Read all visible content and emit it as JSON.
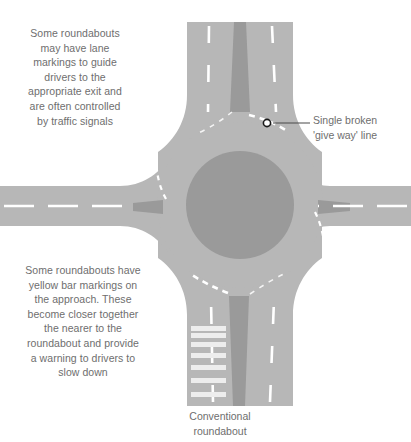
{
  "figure": {
    "caption": "Conventional\nroundabout",
    "notes": [
      {
        "id": "lane-markings-note",
        "text": "Some roundabouts\nmay have lane\nmarkings to guide\ndrivers to the\nappropriate exit and\nare often controlled\nby traffic signals"
      },
      {
        "id": "yellow-bar-note",
        "text": "Some roundabouts have\nyellow bar markings on\nthe approach. These\nbecome closer together\nthe nearer to the\nroundabout and provide\na warning to drivers to\nslow down"
      }
    ],
    "callouts": [
      {
        "id": "give-way-line-callout",
        "text": "Single broken\n'give way' line",
        "marker_x": 267,
        "marker_y": 123,
        "line_end_x": 310,
        "line_end_y": 123
      }
    ]
  },
  "colors": {
    "background": "#ffffff",
    "road_surface": "#b7b7b7",
    "central_island": "#9a9a9a",
    "median_island": "#9a9a9a",
    "lane_marking": "#ffffff",
    "bar_marking": "#ededed",
    "text": "#6e6e6e",
    "callout_line": "#4a4a4a",
    "marker_ring": "#1a1a1a",
    "marker_fill": "#ffffff"
  },
  "diagram": {
    "type": "roundabout-schematic",
    "central_island": {
      "cx": 240,
      "cy": 205,
      "r": 54
    },
    "roundabout_outer": {
      "cx": 240,
      "cy": 205,
      "r": 83
    },
    "approaches": [
      {
        "name": "north-approach",
        "direction": "top",
        "has_median": true,
        "has_lane_markings": true,
        "has_bar_markings": false
      },
      {
        "name": "south-approach",
        "direction": "bottom",
        "has_median": true,
        "has_lane_markings": true,
        "has_bar_markings": true
      },
      {
        "name": "west-approach",
        "direction": "left",
        "has_median": true,
        "has_lane_markings": true,
        "has_bar_markings": false
      },
      {
        "name": "east-approach",
        "direction": "right",
        "has_median": true,
        "has_lane_markings": true,
        "has_bar_markings": false
      }
    ],
    "bar_markings": {
      "count": 7,
      "note": "spacing decreases toward the roundabout"
    }
  }
}
